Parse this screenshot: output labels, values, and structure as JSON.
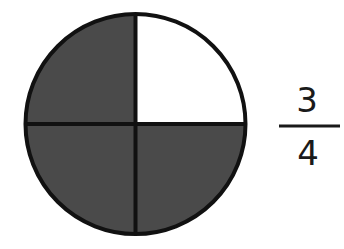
{
  "diagram": {
    "type": "fraction-circle",
    "circle": {
      "cx": 135.5,
      "cy": 124,
      "r": 110,
      "parts": 4,
      "shaded_parts": 3,
      "unshaded_part": "top-right",
      "colors": {
        "shaded": "#4a4a4a",
        "unshaded": "#ffffff",
        "stroke": "#111111"
      },
      "stroke_width": 4
    },
    "quadrants": [
      {
        "position": "top-left",
        "shaded": true
      },
      {
        "position": "top-right",
        "shaded": false
      },
      {
        "position": "bottom-left",
        "shaded": true
      },
      {
        "position": "bottom-right",
        "shaded": true
      }
    ],
    "fraction": {
      "numerator": "3",
      "denominator": "4"
    }
  }
}
